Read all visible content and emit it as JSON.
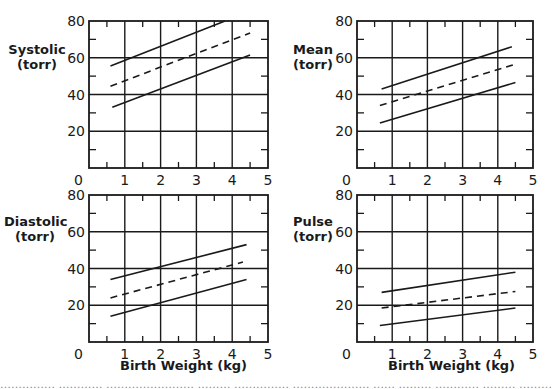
{
  "figure": {
    "caption_fragment": "…………… ………… …………………… ……… …………… ………………… …… ……… ………… ……… ……………"
  },
  "chart_data": [
    {
      "type": "line",
      "title": "",
      "ylabel_line1": "Systolic",
      "ylabel_line2": "(torr)",
      "xlabel": "",
      "xlim": [
        0,
        5
      ],
      "ylim": [
        0,
        80
      ],
      "xticks": [
        "0",
        "1",
        "2",
        "3",
        "4",
        "5"
      ],
      "yticks": [
        "20",
        "40",
        "60",
        "80"
      ],
      "grid": true,
      "series": [
        {
          "name": "upper",
          "style": "solid",
          "x": [
            0.6,
            3.8
          ],
          "y": [
            55.5,
            80
          ]
        },
        {
          "name": "mean",
          "style": "dashed",
          "x": [
            0.6,
            4.5
          ],
          "y": [
            44.5,
            73.5
          ]
        },
        {
          "name": "lower",
          "style": "solid",
          "x": [
            0.65,
            4.5
          ],
          "y": [
            33,
            61.5
          ]
        }
      ]
    },
    {
      "type": "line",
      "title": "",
      "ylabel_line1": "Mean",
      "ylabel_line2": "(torr)",
      "xlabel": "",
      "xlim": [
        0,
        5
      ],
      "ylim": [
        0,
        80
      ],
      "xticks": [
        "0",
        "1",
        "2",
        "3",
        "4",
        "5"
      ],
      "yticks": [
        "20",
        "40",
        "60",
        "80"
      ],
      "grid": true,
      "series": [
        {
          "name": "upper",
          "style": "solid",
          "x": [
            0.7,
            4.4
          ],
          "y": [
            43,
            66
          ]
        },
        {
          "name": "mean",
          "style": "dashed",
          "x": [
            0.65,
            4.5
          ],
          "y": [
            34,
            56.5
          ]
        },
        {
          "name": "lower",
          "style": "solid",
          "x": [
            0.65,
            4.5
          ],
          "y": [
            24.5,
            46.5
          ]
        }
      ]
    },
    {
      "type": "line",
      "title": "",
      "ylabel_line1": "Diastolic",
      "ylabel_line2": "(torr)",
      "xlabel": "Birth Weight (kg)",
      "xlim": [
        0,
        5
      ],
      "ylim": [
        0,
        80
      ],
      "xticks": [
        "0",
        "1",
        "2",
        "3",
        "4",
        "5"
      ],
      "yticks": [
        "20",
        "40",
        "60",
        "80"
      ],
      "grid": true,
      "series": [
        {
          "name": "upper",
          "style": "solid",
          "x": [
            0.6,
            4.4
          ],
          "y": [
            34,
            53
          ]
        },
        {
          "name": "mean",
          "style": "dashed",
          "x": [
            0.6,
            4.3
          ],
          "y": [
            24,
            43.5
          ]
        },
        {
          "name": "lower",
          "style": "solid",
          "x": [
            0.6,
            4.4
          ],
          "y": [
            14,
            34
          ]
        }
      ]
    },
    {
      "type": "line",
      "title": "",
      "ylabel_line1": "Pulse",
      "ylabel_line2": "(torr)",
      "xlabel": "Birth Weight (kg)",
      "xlim": [
        0,
        5
      ],
      "ylim": [
        0,
        80
      ],
      "xticks": [
        "0",
        "1",
        "2",
        "3",
        "4",
        "5"
      ],
      "yticks": [
        "20",
        "40",
        "60",
        "80"
      ],
      "grid": true,
      "series": [
        {
          "name": "upper",
          "style": "solid",
          "x": [
            0.7,
            4.5
          ],
          "y": [
            27,
            38
          ]
        },
        {
          "name": "mean",
          "style": "dashed",
          "x": [
            0.7,
            4.5
          ],
          "y": [
            18.5,
            27.5
          ]
        },
        {
          "name": "lower",
          "style": "solid",
          "x": [
            0.65,
            4.5
          ],
          "y": [
            9,
            18.5
          ]
        }
      ]
    }
  ]
}
